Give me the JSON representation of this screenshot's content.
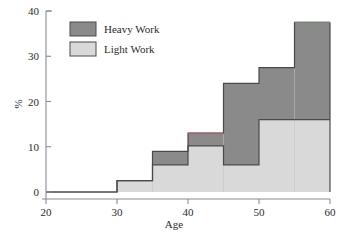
{
  "chart_data": {
    "type": "bar",
    "title": "",
    "subtitle": "",
    "xlabel": "Age",
    "ylabel": "%",
    "xlim": [
      20,
      60
    ],
    "ylim": [
      0,
      40
    ],
    "xticks": [
      20,
      30,
      40,
      50,
      60
    ],
    "yticks": [
      0,
      10,
      20,
      30,
      40
    ],
    "grid": false,
    "legend_position": "top-left",
    "stacked": true,
    "bin_edges": [
      20,
      30,
      35,
      40,
      45,
      50,
      55,
      60
    ],
    "series": [
      {
        "name": "Light Work",
        "color": "#d9d9d9",
        "values": [
          0,
          2.5,
          6.0,
          10.2,
          6.0,
          16.0,
          16.0
        ]
      },
      {
        "name": "Heavy Work",
        "color": "#8a8a8a",
        "values": [
          0,
          0,
          3.0,
          2.8,
          18.0,
          11.5,
          21.5
        ]
      }
    ],
    "cumulative_tops": [
      0,
      2.5,
      9.0,
      13.0,
      24.0,
      27.5,
      37.5
    ],
    "annotations": []
  },
  "axes": {
    "x_tick_labels": [
      "20",
      "30",
      "40",
      "50",
      "60"
    ],
    "y_tick_labels": [
      "0",
      "10",
      "20",
      "30",
      "40"
    ],
    "x_axis_title": "Age",
    "y_axis_title": "%"
  },
  "legend": {
    "items": [
      {
        "label": "Heavy Work",
        "swatch_color": "#8a8a8a"
      },
      {
        "label": "Light Work",
        "swatch_color": "#d9d9d9"
      }
    ]
  },
  "style": {
    "axis_color": "#8a8a9a",
    "outline_color": "#4a4a4a",
    "heavy_color": "#8a8a8a",
    "light_color": "#d9d9d9",
    "background": "#ffffff"
  }
}
